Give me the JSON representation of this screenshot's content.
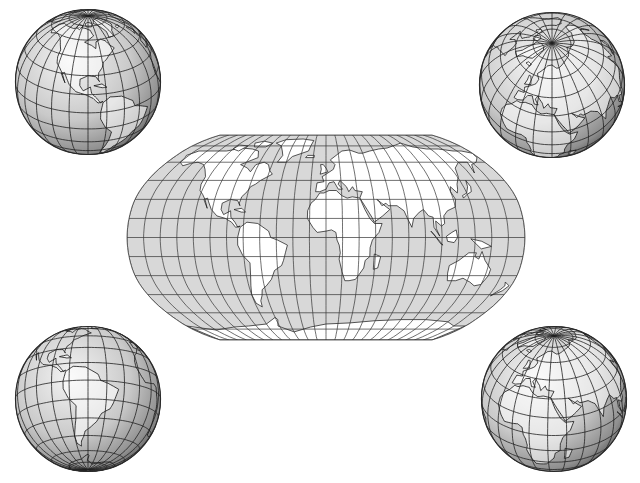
{
  "figure": {
    "background": "#ffffff",
    "ocean_fill": "#d8d8d8",
    "land_fill": "#ffffff",
    "grid_color": "#333333",
    "coast_color": "#111111"
  },
  "center_map": {
    "projection": "Robinson",
    "bbox": {
      "x": 127,
      "y": 135,
      "w": 398,
      "h": 205
    },
    "graticule_spacing_deg": 15
  },
  "globes": [
    {
      "id": "globe-top-left",
      "cx": 88,
      "cy": 82,
      "r": 73,
      "view": "Americas (North America centered)",
      "center_lon": -90,
      "center_lat": 25
    },
    {
      "id": "globe-top-right",
      "cx": 552,
      "cy": 85,
      "r": 73,
      "view": "Arctic / North Pole, Eurasia",
      "center_lon": 30,
      "center_lat": 55
    },
    {
      "id": "globe-bottom-left",
      "cx": 88,
      "cy": 399,
      "r": 73,
      "view": "South America",
      "center_lon": -60,
      "center_lat": -15
    },
    {
      "id": "globe-bottom-right",
      "cx": 554,
      "cy": 399,
      "r": 73,
      "view": "Europe / Africa / Asia",
      "center_lon": 35,
      "center_lat": 30
    }
  ]
}
